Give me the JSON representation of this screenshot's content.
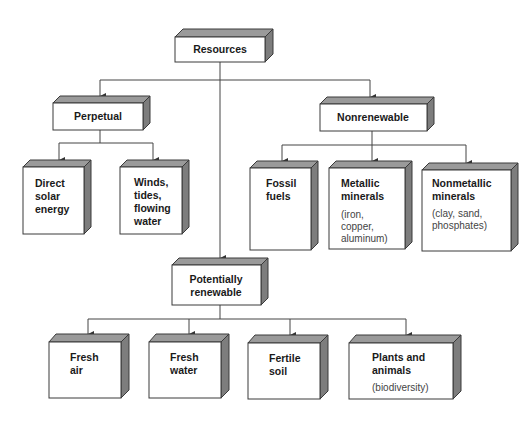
{
  "diagram": {
    "type": "hierarchy",
    "root": {
      "label": "Resources",
      "children": [
        {
          "label": "Perpetual",
          "children": [
            {
              "lines": [
                "Direct",
                "solar",
                "energy"
              ],
              "note": []
            },
            {
              "lines": [
                "Winds,",
                "tides,",
                "flowing",
                "water"
              ],
              "note": []
            }
          ]
        },
        {
          "label": "Nonrenewable",
          "children": [
            {
              "lines": [
                "Fossil",
                "fuels"
              ],
              "note": []
            },
            {
              "lines": [
                "Metallic",
                "minerals"
              ],
              "note": [
                "(iron,",
                "copper,",
                "aluminum)"
              ]
            },
            {
              "lines": [
                "Nonmetallic",
                "minerals"
              ],
              "note": [
                "(clay, sand,",
                "phosphates)"
              ]
            }
          ]
        },
        {
          "label": "Potentially renewable",
          "label_lines": [
            "Potentially",
            "renewable"
          ],
          "children": [
            {
              "lines": [
                "Fresh",
                "air"
              ],
              "note": []
            },
            {
              "lines": [
                "Fresh",
                "water"
              ],
              "note": []
            },
            {
              "lines": [
                "Fertile",
                "soil"
              ],
              "note": []
            },
            {
              "lines": [
                "Plants and",
                "animals"
              ],
              "note": [
                "(biodiversity)"
              ]
            }
          ]
        }
      ]
    }
  },
  "text": {
    "resources": "Resources",
    "perpetual": "Perpetual",
    "nonrenewable": "Nonrenewable",
    "potentially_1": "Potentially",
    "potentially_2": "renewable",
    "solar_1": "Direct",
    "solar_2": "solar",
    "solar_3": "energy",
    "winds_1": "Winds,",
    "winds_2": "tides,",
    "winds_3": "flowing",
    "winds_4": "water",
    "fossil_1": "Fossil",
    "fossil_2": "fuels",
    "metallic_1": "Metallic",
    "metallic_2": "minerals",
    "metallic_n1": "(iron,",
    "metallic_n2": "copper,",
    "metallic_n3": "aluminum)",
    "nonmetallic_1": "Nonmetallic",
    "nonmetallic_2": "minerals",
    "nonmetallic_n1": "(clay, sand,",
    "nonmetallic_n2": "phosphates)",
    "air_1": "Fresh",
    "air_2": "air",
    "water_1": "Fresh",
    "water_2": "water",
    "soil_1": "Fertile",
    "soil_2": "soil",
    "plants_1": "Plants and",
    "plants_2": "animals",
    "plants_n1": "(biodiversity)"
  },
  "colors": {
    "box_top": "#9a9a9a",
    "box_side": "#7d7d7d",
    "box_front": "#ffffff",
    "line": "#444444"
  }
}
